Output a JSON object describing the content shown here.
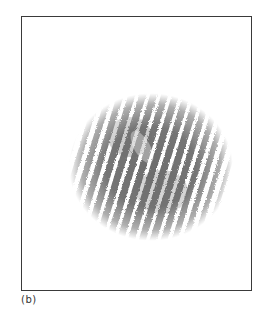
{
  "figure": {
    "panel_label": "(b)",
    "content_description": "interference-fringe-pattern",
    "fringe": {
      "count": 15,
      "spacing_px": 10.5,
      "tilt_deg": 17,
      "stripe_color": "#6e6e6e",
      "envelope_center": [
        129,
        150
      ],
      "envelope_radii": [
        80,
        72
      ]
    },
    "frame_color": "#3a3a3a",
    "background_color": "#ffffff"
  }
}
